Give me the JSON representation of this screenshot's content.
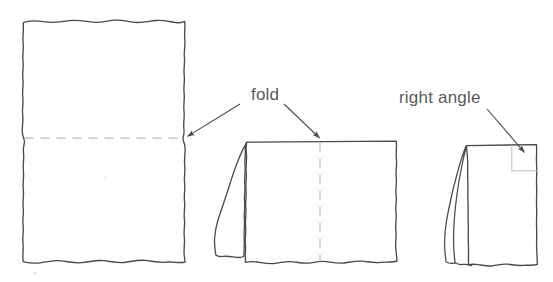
{
  "figure": {
    "background_color": "#ffffff",
    "stroke_color": "#4a4a4a",
    "dashed_color": "#b9b9b9",
    "text_color": "#5a5a5a",
    "annotation_color": "#6e6e6e",
    "right_angle_marker_color": "#c8c8c8"
  },
  "labels": {
    "fold": "fold",
    "right_angle": "right angle"
  },
  "shapes": [
    {
      "name": "unfolded-sheet",
      "step": 1,
      "description": "full rectangular sheet with horizontal dashed fold line across the middle",
      "bounds": {
        "x": 22,
        "y": 20,
        "width": 163,
        "height": 242
      },
      "fold_line": {
        "orientation": "horizontal",
        "y": 138
      },
      "flaps": 0
    },
    {
      "name": "half-folded-sheet",
      "step": 2,
      "description": "sheet folded once, one flap on the left, vertical dashed fold line down the middle",
      "bounds": {
        "x": 214,
        "y": 141,
        "width": 183,
        "height": 131
      },
      "fold_line": {
        "orientation": "vertical",
        "x": 320
      },
      "flaps": 1
    },
    {
      "name": "quarter-folded-sheet",
      "step": 3,
      "description": "sheet folded twice, two flaps on the left, right angle marked at top right corner",
      "bounds": {
        "x": 455,
        "y": 144,
        "width": 82,
        "height": 128
      },
      "fold_line": null,
      "flaps": 2,
      "right_angle_marker": {
        "x": 512,
        "y": 144,
        "size": 26
      }
    }
  ],
  "annotations": [
    {
      "name": "fold-annotation",
      "label": "fold",
      "label_position": {
        "x": 251,
        "y": 95
      },
      "arrows": [
        {
          "from": {
            "x": 238,
            "y": 103
          },
          "to": {
            "x": 186,
            "y": 137
          },
          "target": "unfolded-sheet fold line"
        },
        {
          "from": {
            "x": 283,
            "y": 103
          },
          "to": {
            "x": 320,
            "y": 139
          },
          "target": "half-folded-sheet fold line"
        }
      ]
    },
    {
      "name": "right-angle-annotation",
      "label": "right angle",
      "label_position": {
        "x": 400,
        "y": 99
      },
      "arrows": [
        {
          "from": {
            "x": 487,
            "y": 108
          },
          "to": {
            "x": 524,
            "y": 152
          },
          "target": "quarter-folded-sheet corner"
        }
      ]
    }
  ]
}
